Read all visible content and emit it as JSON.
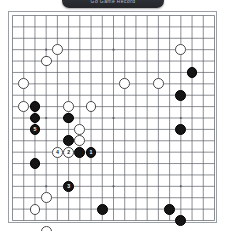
{
  "header": {
    "title": "Go Game Record",
    "bar_color": "#2c2f34"
  },
  "board": {
    "name": "go-board",
    "size": 19,
    "line_color": "#5a5f66",
    "background_color": "#ffffff",
    "border_color": "#9aa0a6",
    "star_points": [
      [
        3,
        3
      ],
      [
        9,
        3
      ],
      [
        15,
        3
      ],
      [
        3,
        9
      ],
      [
        9,
        9
      ],
      [
        15,
        9
      ],
      [
        3,
        15
      ],
      [
        9,
        15
      ],
      [
        15,
        15
      ]
    ],
    "legend": {
      "black_label": "Black",
      "white_label": "White"
    },
    "stones": [
      {
        "x": 2,
        "y": 8,
        "color": "black",
        "label": ""
      },
      {
        "x": 2,
        "y": 9,
        "color": "black",
        "label": ""
      },
      {
        "x": 2,
        "y": 10,
        "color": "black",
        "label": "5"
      },
      {
        "x": 2,
        "y": 13,
        "color": "black",
        "label": ""
      },
      {
        "x": 5,
        "y": 9,
        "color": "black",
        "label": ""
      },
      {
        "x": 5,
        "y": 11,
        "color": "black",
        "label": ""
      },
      {
        "x": 5,
        "y": 12,
        "color": "white",
        "label": "2"
      },
      {
        "x": 4,
        "y": 12,
        "color": "white",
        "label": "4"
      },
      {
        "x": 6,
        "y": 12,
        "color": "black",
        "label": ""
      },
      {
        "x": 7,
        "y": 12,
        "color": "black",
        "label": "1"
      },
      {
        "x": 5,
        "y": 15,
        "color": "black",
        "label": "3"
      },
      {
        "x": 1,
        "y": 6,
        "color": "white",
        "label": ""
      },
      {
        "x": 1,
        "y": 8,
        "color": "white",
        "label": ""
      },
      {
        "x": 4,
        "y": 3,
        "color": "white",
        "label": ""
      },
      {
        "x": 5,
        "y": 8,
        "color": "white",
        "label": ""
      },
      {
        "x": 7,
        "y": 8,
        "color": "white",
        "label": ""
      },
      {
        "x": 6,
        "y": 10,
        "color": "white",
        "label": ""
      },
      {
        "x": 6,
        "y": 11,
        "color": "white",
        "label": ""
      },
      {
        "x": 10,
        "y": 6,
        "color": "white",
        "label": ""
      },
      {
        "x": 13,
        "y": 6,
        "color": "white",
        "label": ""
      },
      {
        "x": 15,
        "y": 3,
        "color": "white",
        "label": ""
      },
      {
        "x": 16,
        "y": 5,
        "color": "black",
        "label": ""
      },
      {
        "x": 15,
        "y": 7,
        "color": "black",
        "label": ""
      },
      {
        "x": 15,
        "y": 10,
        "color": "black",
        "label": ""
      },
      {
        "x": 3,
        "y": 4,
        "color": "white",
        "label": ""
      },
      {
        "x": 3,
        "y": 16,
        "color": "white",
        "label": ""
      },
      {
        "x": 2,
        "y": 17,
        "color": "white",
        "label": ""
      },
      {
        "x": 3,
        "y": 19,
        "color": "white",
        "label": ""
      },
      {
        "x": 5,
        "y": 20,
        "color": "white",
        "label": ""
      },
      {
        "x": 8,
        "y": 17,
        "color": "black",
        "label": ""
      },
      {
        "x": 14,
        "y": 17,
        "color": "black",
        "label": ""
      },
      {
        "x": 15,
        "y": 18,
        "color": "black",
        "label": ""
      }
    ]
  }
}
